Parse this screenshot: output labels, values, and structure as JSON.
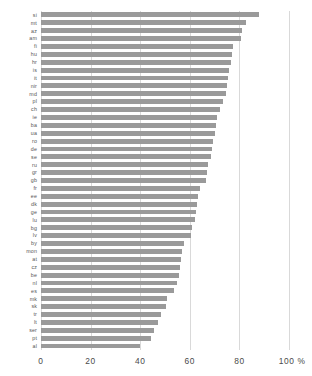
{
  "chart_data": {
    "type": "bar",
    "orientation": "horizontal",
    "title": "",
    "subtitle": "",
    "xlabel": "",
    "ylabel": "",
    "unit": "%",
    "xlim": [
      0,
      100
    ],
    "grid": true,
    "grid_axis": "x",
    "legend": false,
    "bar_color": "#9a9a9a",
    "grid_color": "#d9d9d9",
    "axis_tick_values": [
      0,
      20,
      40,
      60,
      80,
      100
    ],
    "axis_tick_labels": [
      "0",
      "20",
      "40",
      "60",
      "80",
      "100 %"
    ],
    "categories": [
      "si",
      "mt",
      "az",
      "am",
      "fi",
      "hu",
      "hr",
      "is",
      "it",
      "nir",
      "md",
      "pl",
      "ch",
      "ie",
      "ba",
      "ua",
      "ro",
      "de",
      "se",
      "ru",
      "gr",
      "gb",
      "fr",
      "ee",
      "dk",
      "ge",
      "lu",
      "bg",
      "lv",
      "by",
      "mon",
      "at",
      "cz",
      "be",
      "nl",
      "es",
      "mk",
      "sk",
      "tr",
      "lt",
      "ser",
      "pt",
      "al"
    ],
    "values": [
      88.0,
      82.5,
      81.0,
      80.5,
      77.5,
      77.0,
      76.5,
      76.0,
      75.5,
      75.0,
      74.5,
      73.5,
      72.0,
      71.0,
      70.5,
      70.0,
      69.5,
      69.0,
      68.5,
      67.5,
      67.0,
      66.5,
      64.0,
      63.5,
      63.0,
      62.5,
      62.0,
      61.0,
      60.5,
      57.5,
      57.0,
      56.5,
      56.0,
      55.5,
      55.0,
      53.5,
      51.0,
      50.5,
      48.5,
      47.0,
      45.5,
      44.5,
      40.0
    ]
  }
}
